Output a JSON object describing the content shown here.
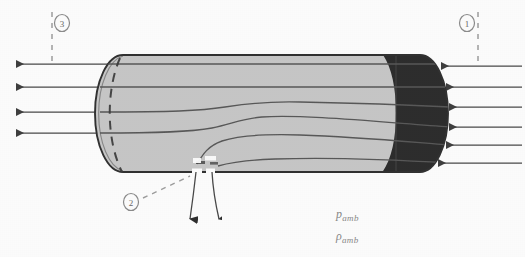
{
  "figure": {
    "type": "technical-schematic",
    "background_color": "#ffffff"
  },
  "colors": {
    "body_light_fill": "#c9c9c9",
    "body_dark_fill": "#2e2e2e",
    "outline": "#3a3a3a",
    "streamline": "#555555",
    "arrow": "#4a4a4a",
    "dashed_guide": "#9a9a9a",
    "label_text": "#6a6a6a",
    "amb_text": "#8a8a8a"
  },
  "stations": [
    {
      "id": "station-3",
      "number": "3",
      "cx": 62,
      "cy": 23,
      "guide_x": 52,
      "guide_y1": 12,
      "guide_y2": 62
    },
    {
      "id": "station-1",
      "number": "1",
      "cx": 467,
      "cy": 23,
      "guide_x": 478,
      "guide_y1": 12,
      "guide_y2": 62
    },
    {
      "id": "station-2",
      "number": "2",
      "cx": 131,
      "cy": 202,
      "guide_x": null,
      "guide_y1": null,
      "guide_y2": null
    }
  ],
  "cylinder": {
    "left_x": 95,
    "right_x": 448,
    "top_y": 55,
    "bottom_y": 172,
    "cap_rx": 28,
    "dark_boundary_x": 357,
    "orifice_x": 200,
    "orifice_width": 28
  },
  "outflow_arrows_left": {
    "count": 4,
    "x_start": 118,
    "x_tip": 14,
    "y_values": [
      64,
      87,
      112,
      133
    ]
  },
  "inflow_arrows_right": {
    "count": 6,
    "x_start": 520,
    "x_tip": 440,
    "y_values": [
      66,
      87,
      107,
      127,
      145,
      163
    ]
  },
  "vent_arrows": {
    "count": 2,
    "label": "orifice discharge"
  },
  "streamlines": {
    "count": 6,
    "note": "interior flow lines converging toward bottom orifice"
  },
  "annotations": {
    "pressure_ambient": "p",
    "pressure_ambient_sub": "amb",
    "density_ambient": "ρ",
    "density_ambient_sub": "amb",
    "p_x": 336,
    "p_y": 214,
    "rho_x": 336,
    "rho_y": 236
  }
}
